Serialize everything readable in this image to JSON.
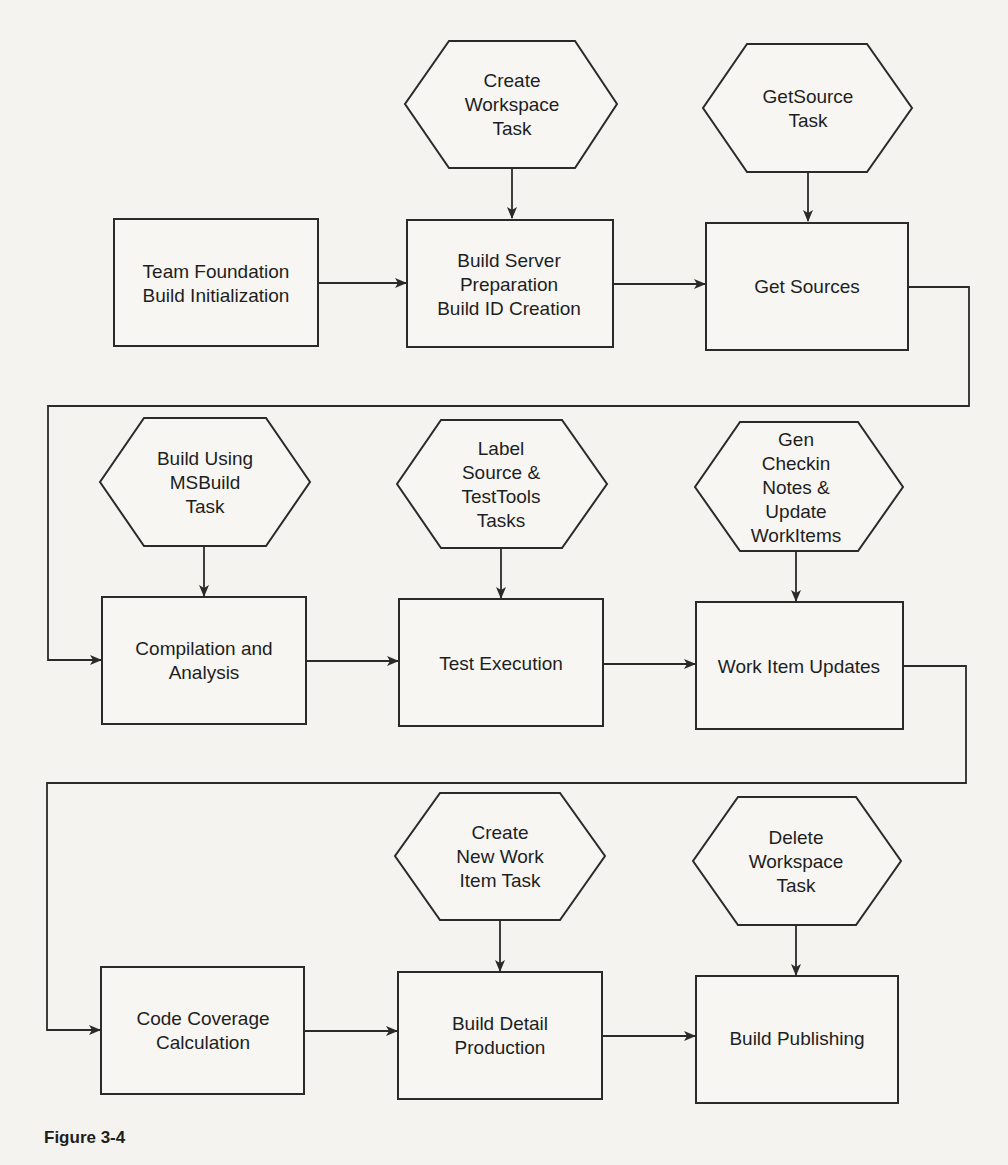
{
  "figure": {
    "caption": "Figure 3-4"
  },
  "nodes": {
    "create_workspace_task": {
      "type": "task",
      "lines": [
        "Create",
        "Workspace",
        "Task"
      ]
    },
    "getsource_task": {
      "type": "task",
      "lines": [
        "GetSource",
        "Task"
      ]
    },
    "team_foundation_build_init": {
      "type": "step",
      "lines": [
        "Team Foundation",
        "Build Initialization"
      ]
    },
    "build_server_prep": {
      "type": "step",
      "lines": [
        "Build Server",
        "Preparation",
        "Build ID Creation"
      ]
    },
    "get_sources": {
      "type": "step",
      "lines": [
        "Get Sources"
      ]
    },
    "build_using_msbuild_task": {
      "type": "task",
      "lines": [
        "Build Using",
        "MSBuild",
        "Task"
      ]
    },
    "label_source_testtools_tasks": {
      "type": "task",
      "lines": [
        "Label",
        "Source &",
        "TestTools",
        "Tasks"
      ]
    },
    "gen_checkin_notes_task": {
      "type": "task",
      "lines": [
        "Gen",
        "Checkin",
        "Notes &",
        "Update",
        "WorkItems"
      ]
    },
    "compilation_and_analysis": {
      "type": "step",
      "lines": [
        "Compilation and",
        "Analysis"
      ]
    },
    "test_execution": {
      "type": "step",
      "lines": [
        "Test Execution"
      ]
    },
    "work_item_updates": {
      "type": "step",
      "lines": [
        "Work Item Updates"
      ]
    },
    "create_new_work_item_task": {
      "type": "task",
      "lines": [
        "Create",
        "New Work",
        "Item Task"
      ]
    },
    "delete_workspace_task": {
      "type": "task",
      "lines": [
        "Delete",
        "Workspace",
        "Task"
      ]
    },
    "code_coverage_calculation": {
      "type": "step",
      "lines": [
        "Code Coverage",
        "Calculation"
      ]
    },
    "build_detail_production": {
      "type": "step",
      "lines": [
        "Build Detail",
        "Production"
      ]
    },
    "build_publishing": {
      "type": "step",
      "lines": [
        "Build Publishing"
      ]
    }
  },
  "edges": [
    {
      "from": "create_workspace_task",
      "to": "build_server_prep"
    },
    {
      "from": "getsource_task",
      "to": "get_sources"
    },
    {
      "from": "team_foundation_build_init",
      "to": "build_server_prep"
    },
    {
      "from": "build_server_prep",
      "to": "get_sources"
    },
    {
      "from": "get_sources",
      "to": "compilation_and_analysis"
    },
    {
      "from": "build_using_msbuild_task",
      "to": "compilation_and_analysis"
    },
    {
      "from": "label_source_testtools_tasks",
      "to": "test_execution"
    },
    {
      "from": "gen_checkin_notes_task",
      "to": "work_item_updates"
    },
    {
      "from": "compilation_and_analysis",
      "to": "test_execution"
    },
    {
      "from": "test_execution",
      "to": "work_item_updates"
    },
    {
      "from": "work_item_updates",
      "to": "code_coverage_calculation"
    },
    {
      "from": "create_new_work_item_task",
      "to": "build_detail_production"
    },
    {
      "from": "delete_workspace_task",
      "to": "build_publishing"
    },
    {
      "from": "code_coverage_calculation",
      "to": "build_detail_production"
    },
    {
      "from": "build_detail_production",
      "to": "build_publishing"
    }
  ]
}
